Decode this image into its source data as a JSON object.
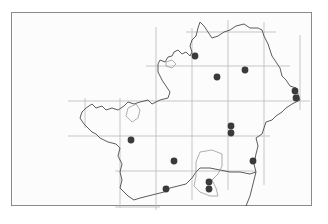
{
  "map": {
    "type": "distribution-map",
    "colors": {
      "background": "#fcfcfc",
      "frame": "#8a8a8a",
      "grid": "#b5b5b5",
      "boundary": "#4a4a4a",
      "water": "#9a9a9a",
      "dot": "#3a3a3a"
    },
    "grid": {
      "vertical_x": [
        85,
        120,
        156,
        192,
        228,
        264,
        300
      ],
      "horizontal_y": [
        32,
        66,
        101,
        136,
        171,
        207
      ]
    },
    "records": [
      {
        "x": 195,
        "y": 56
      },
      {
        "x": 245,
        "y": 70
      },
      {
        "x": 217,
        "y": 77
      },
      {
        "x": 295,
        "y": 91
      },
      {
        "x": 296,
        "y": 98
      },
      {
        "x": 231,
        "y": 126
      },
      {
        "x": 231,
        "y": 133
      },
      {
        "x": 131,
        "y": 140
      },
      {
        "x": 174,
        "y": 161
      },
      {
        "x": 253,
        "y": 161
      },
      {
        "x": 166,
        "y": 189
      },
      {
        "x": 209,
        "y": 182
      },
      {
        "x": 209,
        "y": 189
      }
    ]
  }
}
